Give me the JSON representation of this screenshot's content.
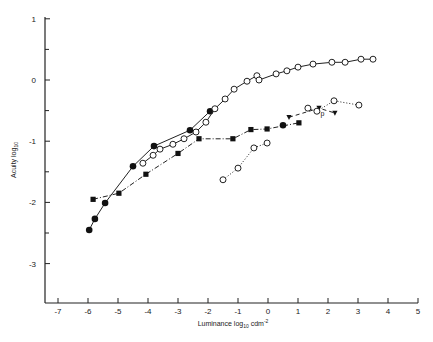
{
  "chart_data": {
    "type": "line",
    "title": "",
    "xlabel": "Luminance log10 cdm-2",
    "xlabel_parts": {
      "main": "Luminance  log",
      "sub": "10",
      "tail": " cdm",
      "sup": "-2"
    },
    "ylabel": "Acuity log10",
    "ylabel_parts": {
      "main": "Acuity log",
      "sub": "10"
    },
    "xlim": [
      -7.4,
      5.0
    ],
    "ylim": [
      -3.65,
      1.0
    ],
    "x_ticks": [
      -7,
      -6,
      -5,
      -4,
      -3,
      -2,
      -1,
      0,
      1,
      2,
      3,
      4,
      5
    ],
    "x_tick_labels": [
      "-7",
      "-6",
      "-5",
      "-4",
      "-3",
      "-2",
      "-1",
      "0",
      "1",
      "2",
      "3",
      "4",
      "5"
    ],
    "y_ticks": [
      1,
      0,
      -1,
      -2,
      -3
    ],
    "y_tick_labels": [
      "1",
      "0",
      "-1",
      "-2",
      "-3"
    ],
    "y_minor_ticks": [
      0.5,
      -0.5,
      -1.5,
      -2.5
    ],
    "grid": false,
    "legend": "none",
    "annotations": [
      {
        "text": "p",
        "x": 1.75,
        "y": -0.59
      }
    ],
    "series": [
      {
        "name": "filled-circles-solid",
        "marker": "filled-circle",
        "line": "solid",
        "points": [
          [
            -5.96,
            -2.45
          ],
          [
            -5.77,
            -2.27
          ],
          [
            -5.43,
            -2.01
          ],
          [
            -4.5,
            -1.41
          ],
          [
            -3.8,
            -1.08
          ],
          [
            -2.6,
            -0.82
          ],
          [
            -1.93,
            -0.51
          ]
        ]
      },
      {
        "name": "open-circles-solid",
        "marker": "open-circle",
        "line": "solid",
        "points": [
          [
            -4.17,
            -1.36
          ],
          [
            -3.83,
            -1.23
          ],
          [
            -3.6,
            -1.13
          ],
          [
            -3.17,
            -1.05
          ],
          [
            -2.8,
            -0.96
          ],
          [
            -2.4,
            -0.85
          ],
          [
            -2.07,
            -0.69
          ],
          [
            -1.77,
            -0.47
          ],
          [
            -1.43,
            -0.31
          ],
          [
            -1.13,
            -0.15
          ],
          [
            -0.7,
            -0.02
          ],
          [
            -0.37,
            0.07
          ],
          [
            -0.3,
            0.0
          ],
          [
            0.27,
            0.1
          ],
          [
            0.63,
            0.15
          ],
          [
            1.0,
            0.21
          ],
          [
            1.5,
            0.26
          ],
          [
            2.13,
            0.29
          ],
          [
            2.57,
            0.29
          ],
          [
            3.1,
            0.34
          ],
          [
            3.5,
            0.34
          ]
        ]
      },
      {
        "name": "filled-squares-dash-dot",
        "marker": "filled-square",
        "line": "dashdot",
        "points": [
          [
            -5.83,
            -1.95
          ],
          [
            -4.97,
            -1.85
          ],
          [
            -4.07,
            -1.54
          ],
          [
            -3.0,
            -1.2
          ],
          [
            -2.3,
            -0.96
          ],
          [
            -1.17,
            -0.96
          ],
          [
            -0.57,
            -0.81
          ],
          [
            -0.03,
            -0.8
          ],
          [
            1.03,
            -0.7
          ]
        ]
      },
      {
        "name": "filled-circle-single",
        "marker": "filled-circle",
        "line": "dashdot",
        "points": [
          [
            0.5,
            -0.74
          ]
        ]
      },
      {
        "name": "open-circles-dotted-lower",
        "marker": "open-circle",
        "line": "dotted",
        "points": [
          [
            -1.5,
            -1.63
          ],
          [
            -1.0,
            -1.44
          ],
          [
            -0.47,
            -1.11
          ],
          [
            -0.03,
            -1.03
          ]
        ]
      },
      {
        "name": "triangles-dashed",
        "marker": "filled-triangle-down",
        "line": "dashed",
        "points": [
          [
            0.7,
            -0.61
          ],
          [
            1.7,
            -0.46
          ],
          [
            2.23,
            -0.54
          ]
        ]
      },
      {
        "name": "open-circles-dotted-upper",
        "marker": "open-circle",
        "line": "dotted",
        "points": [
          [
            1.33,
            -0.46
          ],
          [
            1.63,
            -0.51
          ],
          [
            2.2,
            -0.34
          ],
          [
            3.03,
            -0.41
          ]
        ]
      }
    ]
  }
}
